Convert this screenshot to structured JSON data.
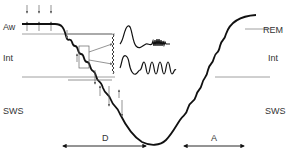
{
  "diagram": {
    "stage_labels_left": {
      "aw": "Aw",
      "int": "Int",
      "sws": "SWS"
    },
    "stage_labels_right": {
      "rem": "REM",
      "int": "Int",
      "sws": "SWS"
    },
    "phase_labels": {
      "descent": "D",
      "ascent": "A"
    },
    "colors": {
      "curve": "#111111",
      "guide_lines": "#888888",
      "arrows": "#555555",
      "text": "#333333"
    }
  }
}
